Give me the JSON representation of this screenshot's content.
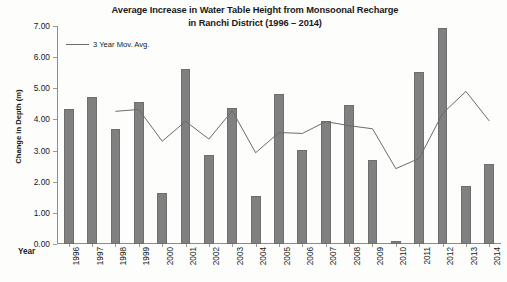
{
  "chart_data": {
    "type": "bar",
    "title": "Average Increase in Water Table Height from Monsoonal Recharge in Ranchi District (1996 – 2014)",
    "title_line1": "Average Increase in Water Table Height from Monsoonal Recharge",
    "title_line2": "in Ranchi District (1996 – 2014)",
    "xlabel": "Year",
    "ylabel": "Change in Depth (m)",
    "ylim": [
      0,
      7
    ],
    "ytick_labels": [
      "0.00",
      "1.00",
      "2.00",
      "3.00",
      "4.00",
      "5.00",
      "6.00",
      "7.00"
    ],
    "ytick_values": [
      0,
      1,
      2,
      3,
      4,
      5,
      6,
      7
    ],
    "grid": false,
    "legend_position": "top-left",
    "categories": [
      "1996",
      "1997",
      "1998",
      "1999",
      "2000",
      "2001",
      "2002",
      "2003",
      "2004",
      "2005",
      "2006",
      "2007",
      "2008",
      "2009",
      "2010",
      "2011",
      "2012",
      "2013",
      "2014"
    ],
    "series": [
      {
        "name": "Change in Depth (m)",
        "type": "bar",
        "color": "#808080",
        "values": [
          4.35,
          4.72,
          3.7,
          4.55,
          1.65,
          5.62,
          2.85,
          4.38,
          1.55,
          4.82,
          3.02,
          3.95,
          4.45,
          2.7,
          0.1,
          5.52,
          6.95,
          1.85,
          2.58
        ]
      },
      {
        "name": "3 Year Mov. Avg.",
        "type": "line",
        "color": "#6b6b6b",
        "values": [
          null,
          null,
          4.26,
          4.32,
          3.3,
          3.94,
          3.37,
          4.28,
          2.93,
          3.58,
          3.55,
          3.93,
          3.8,
          3.7,
          2.42,
          2.75,
          4.19,
          4.9,
          3.95
        ]
      }
    ],
    "legend": [
      {
        "label": "3 Year Mov. Avg.",
        "color": "#6b6b6b",
        "marker": "line"
      }
    ]
  }
}
